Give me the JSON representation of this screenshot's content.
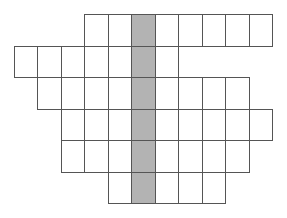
{
  "diagram": {
    "origin": {
      "x": 14,
      "y": 14
    },
    "cell_width": 23.45,
    "cell_height": 31.5,
    "rows": [
      {
        "row": 0,
        "start_col": 3,
        "end_col": 10
      },
      {
        "row": 1,
        "start_col": 0,
        "end_col": 6
      },
      {
        "row": 2,
        "start_col": 1,
        "end_col": 9
      },
      {
        "row": 3,
        "start_col": 2,
        "end_col": 10
      },
      {
        "row": 4,
        "start_col": 2,
        "end_col": 9
      },
      {
        "row": 5,
        "start_col": 4,
        "end_col": 8
      }
    ],
    "shaded_column": 5,
    "colors": {
      "line": "#555555",
      "cell_fill": "#ffffff",
      "shaded_fill": "#b3b3b3"
    }
  }
}
